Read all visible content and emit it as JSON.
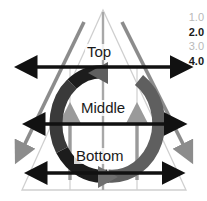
{
  "figure": {
    "name": "three-tier-triangle-cycle-diagram",
    "width": 207,
    "height": 201,
    "background": "#ffffff"
  },
  "tiers": [
    {
      "id": "top",
      "label": "Top",
      "arrow_width_level": "4.0"
    },
    {
      "id": "middle",
      "label": "Middle",
      "arrow_width_level": "3.0"
    },
    {
      "id": "bottom",
      "label": "Bottom",
      "arrow_width_level": "2.0"
    }
  ],
  "legend": {
    "name": "scale-legend",
    "items": [
      {
        "value": "1.0",
        "emphasis": "light",
        "color": "#b9b9b9"
      },
      {
        "value": "2.0",
        "emphasis": "dark",
        "color": "#1a1a1a"
      },
      {
        "value": "3.0",
        "emphasis": "light",
        "color": "#b9b9b9"
      },
      {
        "value": "4.0",
        "emphasis": "dark",
        "color": "#1a1a1a"
      }
    ]
  },
  "shapes": {
    "triangle": {
      "name": "outer-triangle",
      "stroke": "#cfcfcf",
      "apex": [
        103,
        10
      ],
      "base_left": [
        22,
        190
      ],
      "base_right": [
        186,
        190
      ]
    },
    "grid": {
      "name": "grid-lines",
      "stroke": "#cfcfcf",
      "horizontal_y": [
        67,
        125,
        190
      ],
      "vertical_x": [
        70,
        103,
        137
      ]
    },
    "diagonal_arrows": [
      {
        "name": "diagonal-arrow-left",
        "color": "#8c8c8c",
        "from": [
          84,
          22
        ],
        "to": [
          18,
          158
        ]
      },
      {
        "name": "diagonal-arrow-right",
        "color": "#8c8c8c",
        "from": [
          122,
          22
        ],
        "to": [
          190,
          158
        ]
      }
    ],
    "vertical_arrows": [
      {
        "name": "vertical-arrow-left",
        "color": "#9a9a9a",
        "from": [
          70,
          178
        ],
        "to": [
          70,
          110
        ]
      },
      {
        "name": "vertical-arrow-right",
        "color": "#9a9a9a",
        "from": [
          137,
          178
        ],
        "to": [
          137,
          110
        ]
      }
    ],
    "center_line": {
      "name": "center-axis-line",
      "color": "#a8a8a8",
      "from": [
        103,
        10
      ],
      "to": [
        103,
        190
      ]
    },
    "cycle_arrow": {
      "name": "circular-cycle-arrow",
      "direction": "counterclockwise",
      "color_dark": "#1c1c1c",
      "color_mid": "#6f6f6f",
      "center": [
        103,
        124
      ],
      "radius_x": 47,
      "radius_y": 53
    },
    "horizontal_arrows": [
      {
        "name": "horizontal-arrow-top",
        "color": "#111111",
        "y": 67,
        "x1": 22,
        "x2": 186
      },
      {
        "name": "horizontal-arrow-middle",
        "color": "#111111",
        "y": 124,
        "x1": 30,
        "x2": 180
      },
      {
        "name": "horizontal-arrow-bottom",
        "color": "#111111",
        "y": 173,
        "x1": 32,
        "x2": 178
      }
    ]
  }
}
